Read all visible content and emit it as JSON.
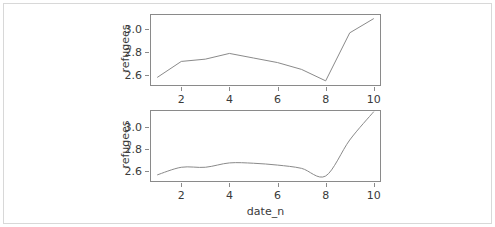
{
  "figure": {
    "background_color": "#ffffff",
    "frame_color": "#d8d8d8",
    "axis_color": "#8a8a8a",
    "line_color": "#8a8a8a",
    "text_color": "#3a3a3a",
    "xlabel": "date_n",
    "panel_count": 2
  },
  "chart_data": [
    {
      "type": "line",
      "panel": "top",
      "title": "",
      "xlabel": "",
      "ylabel": "refugees",
      "x": [
        1,
        2,
        3,
        4,
        5,
        6,
        7,
        8,
        9,
        10
      ],
      "values": [
        2.575,
        2.715,
        2.735,
        2.785,
        2.745,
        2.705,
        2.645,
        2.545,
        2.965,
        3.09
      ],
      "xlim": [
        0.7,
        10.3
      ],
      "ylim": [
        2.5,
        3.13
      ],
      "xticks": [
        2,
        4,
        6,
        8,
        10
      ],
      "xtick_labels": [
        "2",
        "4",
        "6",
        "8",
        "10"
      ],
      "yticks": [
        2.6,
        2.8,
        3.0
      ],
      "ytick_labels": [
        "2.6",
        "2.8",
        "3.0"
      ],
      "grid": false,
      "legend": false,
      "interpolation": "linear"
    },
    {
      "type": "line",
      "panel": "bottom",
      "title": "",
      "xlabel": "date_n",
      "ylabel": "refugees",
      "x": [
        1,
        2,
        3,
        4,
        5,
        6,
        7,
        8,
        9,
        10
      ],
      "values": [
        2.565,
        2.635,
        2.635,
        2.675,
        2.672,
        2.655,
        2.625,
        2.555,
        2.885,
        3.145
      ],
      "xlim": [
        0.7,
        10.3
      ],
      "ylim": [
        2.5,
        3.16
      ],
      "xticks": [
        2,
        4,
        6,
        8,
        10
      ],
      "xtick_labels": [
        "2",
        "4",
        "6",
        "8",
        "10"
      ],
      "yticks": [
        2.6,
        2.8,
        3.0
      ],
      "ytick_labels": [
        "2.6",
        "2.8",
        "3.0"
      ],
      "grid": false,
      "legend": false,
      "interpolation": "smooth"
    }
  ]
}
